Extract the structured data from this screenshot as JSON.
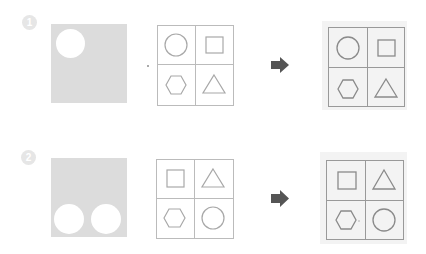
{
  "problems": [
    {
      "badge": "1",
      "source": {
        "holes": 1
      },
      "grid": {
        "cells": [
          "circle",
          "square",
          "hexagon",
          "triangle"
        ]
      },
      "arrow_icon": "right-arrow-icon",
      "result": {
        "cells": [
          "circle",
          "square",
          "hexagon",
          "triangle"
        ]
      }
    },
    {
      "badge": "2",
      "source": {
        "holes": 2
      },
      "grid": {
        "cells": [
          "square",
          "triangle",
          "hexagon",
          "circle"
        ]
      },
      "arrow_icon": "right-arrow-icon",
      "result": {
        "cells": [
          "square",
          "triangle",
          "hexagon",
          "circle"
        ]
      }
    }
  ],
  "colors": {
    "source_fill": "#dcdcdc",
    "grid_line": "#bbbbbb",
    "result_line": "#999999",
    "result_panel": "#f3f3f3",
    "arrow": "#555555",
    "badge": "#e6e6e6"
  }
}
